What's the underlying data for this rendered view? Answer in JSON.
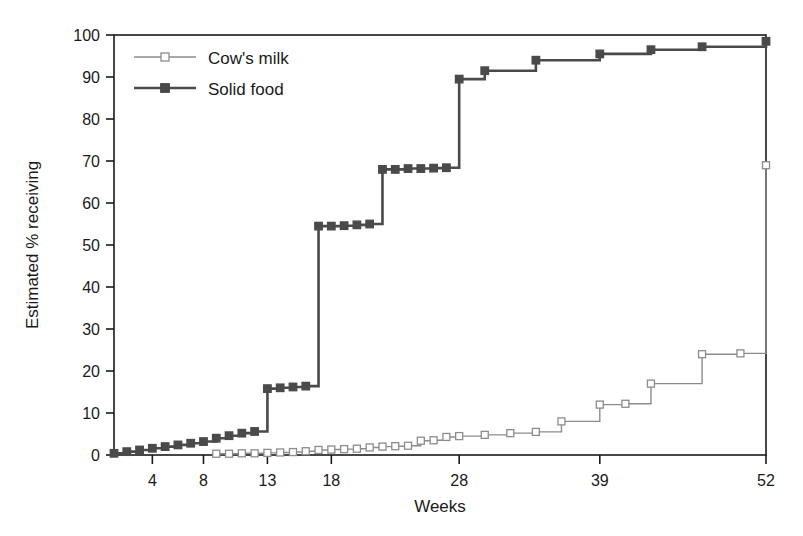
{
  "chart_data": {
    "type": "line",
    "subtype": "step-post",
    "title": "",
    "xlabel": "Weeks",
    "ylabel": "Estimated % receiving",
    "xlim": [
      1,
      52
    ],
    "ylim": [
      0,
      100
    ],
    "xticks": [
      4,
      8,
      13,
      18,
      28,
      39,
      52
    ],
    "yticks": [
      0,
      10,
      20,
      30,
      40,
      50,
      60,
      70,
      80,
      90,
      100
    ],
    "grid": false,
    "legend_position": "top-left",
    "series": [
      {
        "name": "Cow's milk",
        "marker": "open-square",
        "color": "#8c8c8c",
        "marker_fill": "#ffffff",
        "line_width": 1.4,
        "x": [
          9,
          10,
          11,
          12,
          13,
          14,
          15,
          16,
          17,
          18,
          19,
          20,
          21,
          22,
          23,
          24,
          25,
          26,
          27,
          28,
          30,
          32,
          34,
          36,
          39,
          41,
          43,
          47,
          50,
          52
        ],
        "y": [
          0.3,
          0.3,
          0.4,
          0.4,
          0.5,
          0.6,
          0.7,
          0.9,
          1.2,
          1.3,
          1.4,
          1.5,
          1.8,
          2.0,
          2.1,
          2.2,
          3.4,
          3.5,
          4.3,
          4.5,
          4.8,
          5.2,
          5.5,
          8.0,
          12.0,
          12.2,
          17.0,
          24.0,
          24.2,
          69.0
        ]
      },
      {
        "name": "Solid food",
        "marker": "filled-square",
        "color": "#4a4a4a",
        "marker_fill": "#4a4a4a",
        "line_width": 2.6,
        "x": [
          1,
          2,
          3,
          4,
          5,
          6,
          7,
          8,
          9,
          10,
          11,
          12,
          13,
          14,
          15,
          16,
          17,
          18,
          19,
          20,
          21,
          22,
          23,
          24,
          25,
          26,
          27,
          28,
          30,
          34,
          39,
          43,
          47,
          52
        ],
        "y": [
          0.4,
          0.8,
          1.2,
          1.6,
          2.0,
          2.4,
          2.8,
          3.2,
          4.0,
          4.6,
          5.2,
          5.6,
          15.8,
          16.0,
          16.2,
          16.4,
          54.5,
          54.5,
          54.6,
          54.8,
          55.0,
          68.0,
          68.0,
          68.2,
          68.2,
          68.3,
          68.4,
          89.5,
          91.5,
          94.0,
          95.5,
          96.5,
          97.2,
          98.5
        ]
      }
    ]
  },
  "legend": {
    "items": [
      {
        "label": "Cow's milk"
      },
      {
        "label": "Solid food"
      }
    ]
  },
  "axes": {
    "x_title": "Weeks",
    "y_title": "Estimated % receiving",
    "x_tick_labels": [
      "4",
      "8",
      "13",
      "18",
      "28",
      "39",
      "52"
    ],
    "y_tick_labels": [
      "0",
      "10",
      "20",
      "30",
      "40",
      "50",
      "60",
      "70",
      "80",
      "90",
      "100"
    ]
  },
  "colors": {
    "cow_milk": "#8c8c8c",
    "solid_food": "#4a4a4a",
    "axis": "#1a1a1a",
    "background": "#ffffff"
  }
}
